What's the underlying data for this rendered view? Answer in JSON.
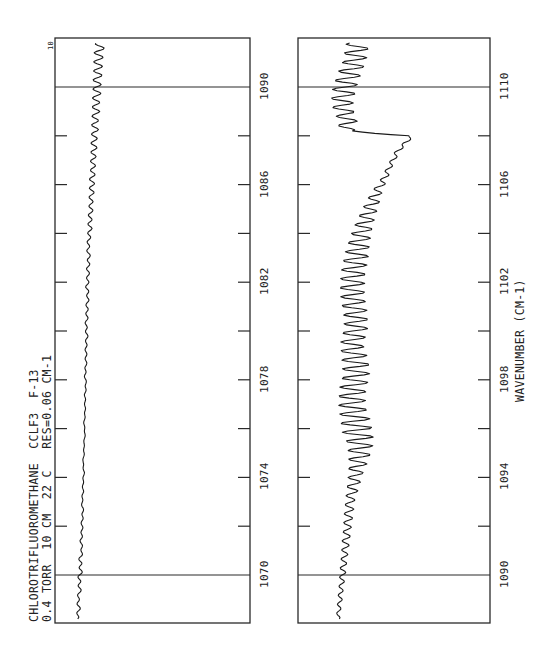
{
  "chart_data": [
    {
      "type": "line",
      "orientation": "rotated -90deg (wavenumber axis vertical, increasing upward)",
      "panel": "left",
      "title": "CHLOROTRIFLUOROMETHANE  CCLF3  F-13",
      "subtitle": "0.4 TORR  10 CM  22 C   RES=0.06 CM-1",
      "xlabel": "WAVENUMBER (CM-1)",
      "ylabel": "",
      "xlim": [
        1068,
        1092
      ],
      "tick_labels": [
        "1070",
        "1074",
        "1078",
        "1082",
        "1086",
        "1090"
      ],
      "minor_ticks": [
        1072,
        1076,
        1080,
        1084,
        1088
      ],
      "reference_lines": [
        1070,
        1090
      ],
      "scale_label": "10",
      "x": [
        1068.2,
        1068.6,
        1069.0,
        1069.4,
        1069.8,
        1070.2,
        1070.6,
        1071.0,
        1071.4,
        1071.8,
        1072.2,
        1072.6,
        1073.0,
        1073.4,
        1073.8,
        1074.2,
        1074.6,
        1075.0,
        1075.4,
        1075.8,
        1076.2,
        1076.6,
        1077.0,
        1077.4,
        1077.8,
        1078.2,
        1078.6,
        1079.0,
        1079.4,
        1079.8,
        1080.2,
        1080.6,
        1081.0,
        1081.4,
        1081.8,
        1082.2,
        1082.6,
        1083.0,
        1083.4,
        1083.8,
        1084.2,
        1084.6,
        1085.0,
        1085.4,
        1085.8,
        1086.2,
        1086.6,
        1087.0,
        1087.4,
        1087.8,
        1088.2,
        1088.6,
        1089.0,
        1089.4,
        1089.8,
        1090.2,
        1090.6,
        1091.0,
        1091.4,
        1091.8
      ],
      "values": [
        22,
        24,
        23,
        25,
        24,
        26,
        25,
        27,
        26,
        27,
        27,
        28,
        27,
        28,
        28,
        29,
        28,
        29,
        29,
        30,
        29,
        30,
        30,
        30,
        31,
        30,
        31,
        31,
        31,
        32,
        31,
        32,
        32,
        33,
        32,
        33,
        33,
        34,
        33,
        34,
        35,
        35,
        36,
        36,
        37,
        37,
        38,
        38,
        39,
        39,
        40,
        40,
        41,
        41,
        42,
        42,
        43,
        43,
        44,
        45
      ],
      "oscillation_amplitude": [
        1,
        1,
        1,
        1,
        1.5,
        1.5,
        1.5,
        1,
        1,
        1,
        1,
        1,
        1,
        1,
        1,
        1,
        1,
        1,
        1,
        1,
        1,
        1,
        1,
        1,
        1,
        1,
        1,
        1,
        1,
        1,
        1,
        1,
        1,
        1,
        1,
        1,
        1,
        1,
        1,
        1,
        1.5,
        1.5,
        1.5,
        1.5,
        2,
        2,
        2,
        2,
        2.5,
        2.5,
        3,
        3,
        3.5,
        3.5,
        4,
        4,
        4.5,
        4.5,
        5,
        5
      ]
    },
    {
      "type": "line",
      "orientation": "rotated -90deg (wavenumber axis vertical, increasing upward)",
      "panel": "right",
      "xlabel": "WAVENUMBER (CM-1)",
      "xlim": [
        1088,
        1112
      ],
      "tick_labels": [
        "1090",
        "1094",
        "1098",
        "1102",
        "1106",
        "1110"
      ],
      "minor_ticks": [
        1092,
        1096,
        1100,
        1104,
        1108
      ],
      "reference_lines": [
        1090,
        1110
      ],
      "x": [
        1088.2,
        1088.6,
        1089.0,
        1089.4,
        1089.8,
        1090.2,
        1090.6,
        1091.0,
        1091.4,
        1091.8,
        1092.2,
        1092.6,
        1093.0,
        1093.4,
        1093.8,
        1094.2,
        1094.6,
        1095.0,
        1095.4,
        1095.8,
        1096.2,
        1096.6,
        1097.0,
        1097.4,
        1097.8,
        1098.2,
        1098.6,
        1099.0,
        1099.4,
        1099.8,
        1100.2,
        1100.6,
        1101.0,
        1101.4,
        1101.8,
        1102.2,
        1102.6,
        1103.0,
        1103.4,
        1103.8,
        1104.2,
        1104.6,
        1105.0,
        1105.4,
        1105.8,
        1106.2,
        1106.6,
        1107.0,
        1107.4,
        1107.8,
        1108.0,
        1108.2,
        1108.6,
        1109.0,
        1109.4,
        1109.8,
        1110.2,
        1110.6,
        1111.0,
        1111.4,
        1111.8
      ],
      "values": [
        40,
        41,
        42,
        43,
        44,
        45,
        46,
        47,
        48,
        49,
        50,
        51,
        52,
        54,
        56,
        58,
        60,
        62,
        62,
        60,
        58,
        56,
        54,
        54,
        56,
        58,
        58,
        56,
        54,
        56,
        58,
        58,
        56,
        55,
        54,
        55,
        56,
        58,
        60,
        62,
        65,
        68,
        72,
        76,
        80,
        86,
        90,
        95,
        100,
        110,
        112,
        48,
        50,
        46,
        44,
        46,
        48,
        52,
        56,
        58,
        60
      ],
      "oscillation_amplitude": [
        1.5,
        1.5,
        2,
        2,
        2.5,
        3,
        3,
        3.5,
        4,
        4,
        4.5,
        5,
        5,
        6,
        7,
        8,
        10,
        12,
        14,
        16,
        16,
        15,
        14,
        14,
        14,
        14,
        14,
        13,
        12,
        12,
        12,
        12,
        12,
        12,
        12,
        12,
        12,
        12,
        11,
        10,
        9,
        8,
        7,
        6,
        4,
        3,
        2,
        2,
        2,
        2,
        1,
        8,
        9,
        10,
        11,
        12,
        12,
        12,
        12,
        12,
        12
      ]
    }
  ],
  "annotations": {
    "title_line1": "CHLOROTRIFLUOROMETHANE  CCLF3  F-13",
    "title_line2": "0.4 TORR  10 CM  22 C   RES=0.06 CM-1",
    "scale_label": "10",
    "axis_label": "WAVENUMBER (CM-1)",
    "left_ticks": [
      "1070",
      "1074",
      "1078",
      "1082",
      "1086",
      "1090"
    ],
    "right_ticks": [
      "1090",
      "1094",
      "1098",
      "1102",
      "1106",
      "1110"
    ]
  },
  "colors": {
    "ink": "#1a1a1a",
    "frame": "#2a2a2a",
    "background": "#ffffff"
  }
}
